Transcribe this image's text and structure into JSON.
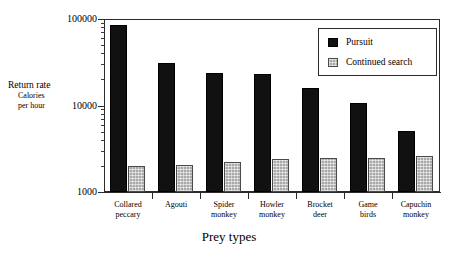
{
  "chart_data": {
    "type": "bar",
    "title": "",
    "xlabel": "Prey types",
    "ylabel": "Return rate",
    "ylabel_sub_line1": "Calories",
    "ylabel_sub_line2": "per hour",
    "yscale": "log",
    "ylim": [
      1000,
      100000
    ],
    "ytick_labels": [
      "100000",
      "10000",
      "1000"
    ],
    "ytick_values": [
      100000,
      10000,
      1000
    ],
    "grid": false,
    "legend_position": "upper right",
    "categories": [
      "Collared peccary",
      "Agouti",
      "Spider monkey",
      "Howler monkey",
      "Brocket deer",
      "Game birds",
      "Capuchin monkey"
    ],
    "category_lines": [
      [
        "Collared",
        "peccary"
      ],
      [
        "Agouti",
        ""
      ],
      [
        "Spider",
        "monkey"
      ],
      [
        "Howler",
        "monkey"
      ],
      [
        "Brocket",
        "deer"
      ],
      [
        "Game",
        "birds"
      ],
      [
        "Capuchin",
        "monkey"
      ]
    ],
    "series": [
      {
        "name": "Pursuit",
        "color": "#111111",
        "values": [
          85000,
          31000,
          23500,
          23000,
          16000,
          10700,
          5100
        ]
      },
      {
        "name": "Continued search",
        "color": "#a9a9a9",
        "values": [
          2000,
          2050,
          2250,
          2400,
          2450,
          2500,
          2600
        ]
      }
    ]
  },
  "legend": {
    "entries": [
      {
        "label": "Pursuit",
        "swatch": "black-square-icon"
      },
      {
        "label": "Continued search",
        "swatch": "gray-square-icon"
      }
    ]
  }
}
